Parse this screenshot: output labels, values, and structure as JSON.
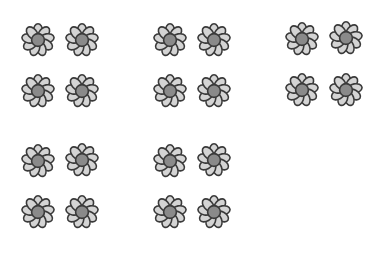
{
  "figure": {
    "groups": [
      {
        "label": "group-1",
        "count": 4,
        "flowers": [
          [
            38,
            40
          ],
          [
            82,
            40
          ],
          [
            38,
            91
          ],
          [
            82,
            91
          ]
        ]
      },
      {
        "label": "group-2",
        "count": 4,
        "flowers": [
          [
            170,
            40
          ],
          [
            214,
            40
          ],
          [
            170,
            91
          ],
          [
            214,
            91
          ]
        ]
      },
      {
        "label": "group-3",
        "count": 4,
        "flowers": [
          [
            302,
            39
          ],
          [
            346,
            38
          ],
          [
            302,
            90
          ],
          [
            346,
            90
          ]
        ]
      },
      {
        "label": "group-4",
        "count": 4,
        "flowers": [
          [
            38,
            161
          ],
          [
            82,
            160
          ],
          [
            38,
            212
          ],
          [
            82,
            212
          ]
        ]
      },
      {
        "label": "group-5",
        "count": 4,
        "flowers": [
          [
            170,
            161
          ],
          [
            214,
            160
          ],
          [
            170,
            212
          ],
          [
            214,
            212
          ]
        ]
      }
    ],
    "total_flowers": 20,
    "colors": {
      "petal": "#d4d4d4",
      "center": "#8a8a8a",
      "outline": "#3a3a3a",
      "background": "#ffffff"
    }
  }
}
